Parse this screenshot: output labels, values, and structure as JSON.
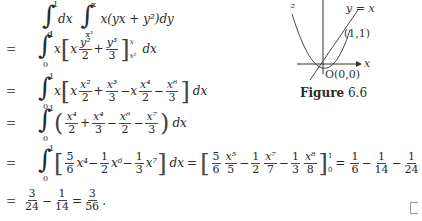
{
  "equations": {
    "line1": {
      "lhs": "",
      "lower1": "0",
      "upper1": "1",
      "d1": "dx",
      "lower2": "x²",
      "upper2": "x",
      "integrand": "x(yx + y²)dy"
    },
    "line2": {
      "eq": "=",
      "lower": "0",
      "upper": "1",
      "pre": "x",
      "t1_num": "y²",
      "t1_den": "2",
      "t2_num": "y³",
      "t2_den": "3",
      "blower": "x²",
      "bupper": "x",
      "post": "dx"
    },
    "line3": {
      "eq": "=",
      "lower": "0",
      "upper": "1",
      "pre": "x",
      "terms": [
        "x x²/2",
        "+ x³/3",
        "− x x⁴/2",
        "− x⁶/3"
      ],
      "post": "dx"
    },
    "line4": {
      "eq": "=",
      "lower": "0",
      "upper": "1",
      "terms": [
        "x⁴/2",
        "+ x⁴/3",
        "− x⁶/2",
        "− x⁷/3"
      ],
      "post": "dx"
    },
    "line5": {
      "eq": "=",
      "lower": "0",
      "upper": "1",
      "integrand": "[5/6 x⁴ − 1/2 x⁶ − 1/3 x⁷] dx",
      "antideriv": "[5/6 x⁵/5 − 1/2 x⁷/7 − 1/3 x⁸/8]₀¹",
      "result": "= 1/6 − 1/14 − 1/24"
    },
    "line6": {
      "eq": "=",
      "expr": "3/24 − 1/14 = 3/56."
    }
  },
  "figure": {
    "label_parabola": "y = x²",
    "label_line": "y = x",
    "point_intersection": "(1,1)",
    "origin": "O(0,0)",
    "axis_x": "x",
    "caption_bold": "Figure",
    "caption_num": "6.6"
  }
}
